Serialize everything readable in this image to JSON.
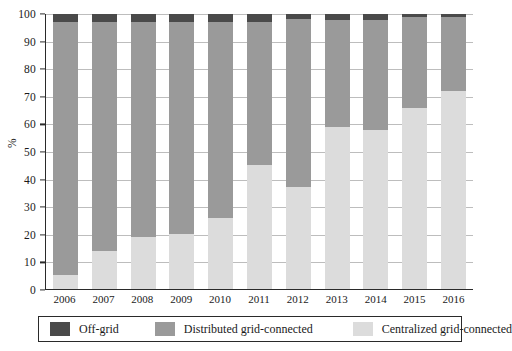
{
  "chart_data": {
    "type": "bar",
    "stacked": true,
    "stack_total": 100,
    "title": "",
    "subtitle": "",
    "xlabel": "",
    "ylabel": "%",
    "ylim": [
      0,
      100
    ],
    "ytick_step": 10,
    "yticks": [
      0,
      10,
      20,
      30,
      40,
      50,
      60,
      70,
      80,
      90,
      100
    ],
    "grid": true,
    "grid_axis": "y",
    "legend_position": "bottom",
    "categories": [
      "2006",
      "2007",
      "2008",
      "2009",
      "2010",
      "2011",
      "2012",
      "2013",
      "2014",
      "2015",
      "2016"
    ],
    "series": [
      {
        "name": "Centralized grid-connected",
        "color": "#dcdcdc",
        "stack_order": 0,
        "values": [
          5,
          14,
          19,
          20,
          26,
          45,
          37,
          59,
          58,
          66,
          72
        ]
      },
      {
        "name": "Distributed grid-connected",
        "color": "#9a9a9a",
        "stack_order": 1,
        "values": [
          92,
          83,
          78,
          77,
          71,
          52,
          61,
          39,
          40,
          33,
          27
        ]
      },
      {
        "name": "Off-grid",
        "color": "#4a4a4a",
        "stack_order": 2,
        "values": [
          3,
          3,
          3,
          3,
          3,
          3,
          2,
          2,
          2,
          1,
          1
        ]
      }
    ]
  },
  "axes": {
    "y_label": "%",
    "y_tick_labels": [
      "0",
      "10",
      "20",
      "30",
      "40",
      "50",
      "60",
      "70",
      "80",
      "90",
      "100"
    ],
    "x_tick_labels": [
      "2006",
      "2007",
      "2008",
      "2009",
      "2010",
      "2011",
      "2012",
      "2013",
      "2014",
      "2015",
      "2016"
    ]
  },
  "legend": {
    "items": [
      {
        "label": "Off-grid",
        "color": "#4a4a4a"
      },
      {
        "label": "Distributed grid-connected",
        "color": "#9a9a9a"
      },
      {
        "label": "Centralized grid-connected",
        "color": "#dcdcdc"
      }
    ]
  },
  "colors": {
    "off_grid": "#4a4a4a",
    "distributed": "#9a9a9a",
    "centralized": "#dcdcdc",
    "axis": "#2a2a2a",
    "grid": "#bdbdbd",
    "background": "#ffffff"
  }
}
